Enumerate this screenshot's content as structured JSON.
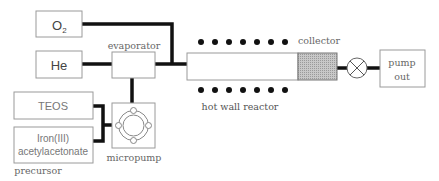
{
  "diagram": {
    "colors": {
      "line": "#111111",
      "box_border": "#9a9a9a",
      "collector_fill": "#bdbdbd",
      "text": "#555555"
    },
    "gases": [
      {
        "id": "o2",
        "label_main": "O",
        "label_sub": "2"
      },
      {
        "id": "he",
        "label": "He"
      }
    ],
    "evaporator": {
      "label": "evaporator"
    },
    "reactor": {
      "label": "hot wall reactor",
      "heater_dots_per_row": 7
    },
    "collector": {
      "label": "collector"
    },
    "valve": {
      "icon": "valve-x-icon"
    },
    "pump_out": {
      "line1": "pump",
      "line2": "out"
    },
    "precursors": {
      "items": [
        {
          "line1": "TEOS"
        },
        {
          "line1": "Iron(III)",
          "line2": "acetylacetonate"
        }
      ],
      "group_label": "precursor"
    },
    "micropump": {
      "label": "micropump"
    }
  }
}
